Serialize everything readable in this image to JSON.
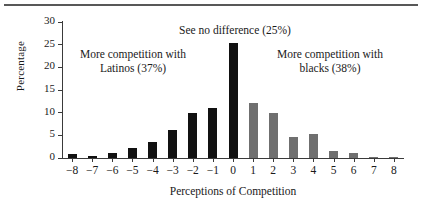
{
  "figure": {
    "has_top_rule": true,
    "colors": {
      "bar_negative": "#111111",
      "bar_positive": "#6f6f6f",
      "axis": "#3a3a3a",
      "text": "#1a1a1a",
      "rule": "#585858"
    }
  },
  "chart_data": {
    "type": "bar",
    "title": "",
    "xlabel": "Perceptions of Competition",
    "ylabel": "Percentage",
    "categories": [
      "-8",
      "-7",
      "-6",
      "-5",
      "-4",
      "-3",
      "-2",
      "-1",
      "0",
      "1",
      "2",
      "3",
      "4",
      "5",
      "6",
      "7",
      "8"
    ],
    "values": [
      0.8,
      0.4,
      1.1,
      2.1,
      3.5,
      6.1,
      10.0,
      11.1,
      25.3,
      12.1,
      9.9,
      4.6,
      5.2,
      1.5,
      1.1,
      0.2,
      0.3
    ],
    "bar_colors": [
      "#111111",
      "#111111",
      "#111111",
      "#111111",
      "#111111",
      "#111111",
      "#111111",
      "#111111",
      "#111111",
      "#6f6f6f",
      "#6f6f6f",
      "#6f6f6f",
      "#6f6f6f",
      "#6f6f6f",
      "#6f6f6f",
      "#6f6f6f",
      "#6f6f6f"
    ],
    "ylim": [
      0,
      30
    ],
    "yticks": [
      0,
      5,
      10,
      15,
      20,
      25,
      30
    ],
    "ytick_labels": [
      "0",
      "5",
      "10",
      "15",
      "20",
      "25",
      "30"
    ],
    "grid": false,
    "legend": "none",
    "annotations": [
      {
        "id": "center",
        "text": "See no difference (25%)"
      },
      {
        "id": "left",
        "text": "More competition with\nLatinos (37%)"
      },
      {
        "id": "right",
        "text": "More competition with\nblacks (38%)"
      }
    ]
  }
}
